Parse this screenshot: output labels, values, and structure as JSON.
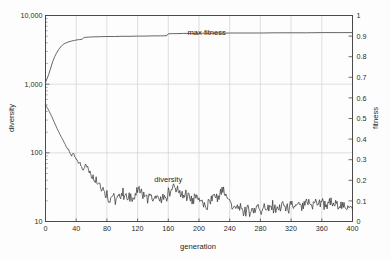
{
  "chart_data": {
    "type": "line",
    "title": "",
    "xlabel": "generation",
    "ylabel": "diversity",
    "y2label": "fitness",
    "xlim": [
      0,
      400
    ],
    "ylim": [
      10,
      10000
    ],
    "yscale": "log",
    "y2lim": [
      0,
      1
    ],
    "y2scale": "linear",
    "grid": true,
    "legend_position": "inline-annotation",
    "xticks": [
      "0",
      "40",
      "80",
      "120",
      "160",
      "200",
      "240",
      "280",
      "320",
      "360",
      "400"
    ],
    "xtick_values": [
      0,
      40,
      80,
      120,
      160,
      200,
      240,
      280,
      320,
      360,
      400
    ],
    "yticks": [
      "10,000",
      "1,000",
      "100",
      "10"
    ],
    "ytick_values": [
      10000,
      1000,
      100,
      10
    ],
    "y2ticks": [
      "1",
      "0.9",
      "0.8",
      "0.7",
      "0.6",
      "0.5",
      "0.4",
      "0.3",
      "0.2",
      "0.1",
      "0"
    ],
    "y2tick_values": [
      1,
      0.9,
      0.8,
      0.7,
      0.6,
      0.5,
      0.4,
      0.3,
      0.2,
      0.1,
      0
    ],
    "annotations": [
      {
        "text": "max fitness",
        "x": 210,
        "y": 0.905
      },
      {
        "text": "diversity",
        "x": 160,
        "y": 38
      }
    ],
    "series": [
      {
        "name": "max fitness",
        "axis": "right",
        "color": "#555555",
        "x": [
          0,
          2,
          4,
          6,
          8,
          10,
          12,
          14,
          16,
          18,
          20,
          22,
          24,
          26,
          28,
          30,
          32,
          34,
          36,
          38,
          40,
          44,
          48,
          50,
          52,
          56,
          60,
          70,
          80,
          90,
          100,
          110,
          120,
          130,
          140,
          150,
          158,
          160,
          165,
          170,
          180,
          190,
          200,
          220,
          240,
          260,
          280,
          300,
          320,
          340,
          360,
          380,
          400
        ],
        "values": [
          0.676,
          0.693,
          0.712,
          0.735,
          0.76,
          0.782,
          0.8,
          0.815,
          0.828,
          0.839,
          0.848,
          0.856,
          0.862,
          0.866,
          0.869,
          0.872,
          0.874,
          0.876,
          0.878,
          0.879,
          0.881,
          0.883,
          0.885,
          0.893,
          0.894,
          0.895,
          0.896,
          0.897,
          0.898,
          0.898,
          0.899,
          0.899,
          0.9,
          0.9,
          0.901,
          0.901,
          0.902,
          0.911,
          0.912,
          0.912,
          0.913,
          0.913,
          0.914,
          0.914,
          0.915,
          0.915,
          0.915,
          0.916,
          0.916,
          0.916,
          0.917,
          0.917,
          0.917
        ]
      },
      {
        "name": "diversity",
        "axis": "left",
        "color": "#3a3a3a",
        "x": [
          0,
          4,
          8,
          12,
          16,
          20,
          24,
          28,
          32,
          34,
          36,
          38,
          40,
          44,
          48,
          52,
          56,
          60,
          64,
          68,
          72,
          76,
          80,
          84,
          88,
          92,
          96,
          100,
          104,
          108,
          112,
          116,
          120,
          124,
          128,
          132,
          136,
          140,
          144,
          148,
          152,
          156,
          160,
          164,
          168,
          172,
          176,
          180,
          184,
          188,
          192,
          196,
          200,
          204,
          208,
          212,
          216,
          220,
          224,
          228,
          232,
          236,
          240,
          244,
          248,
          252,
          256,
          260,
          264,
          268,
          272,
          276,
          280,
          284,
          288,
          292,
          296,
          300,
          304,
          308,
          312,
          316,
          320,
          324,
          328,
          332,
          336,
          340,
          344,
          348,
          352,
          356,
          360,
          364,
          368,
          372,
          376,
          380,
          384,
          388,
          392,
          396,
          400
        ],
        "values": [
          500,
          420,
          340,
          270,
          215,
          175,
          145,
          120,
          100,
          92,
          96,
          88,
          80,
          70,
          62,
          66,
          58,
          50,
          44,
          38,
          33,
          29,
          25,
          21,
          24,
          20,
          23,
          26,
          24,
          21,
          25,
          22,
          27,
          31,
          24,
          21,
          25,
          20,
          24,
          19,
          23,
          21,
          26,
          30,
          33,
          28,
          25,
          22,
          26,
          23,
          20,
          24,
          22,
          19,
          15,
          18,
          22,
          25,
          21,
          26,
          28,
          24,
          20,
          17,
          15,
          16,
          14,
          15,
          16,
          14,
          15,
          16,
          15,
          17,
          16,
          15,
          17,
          16,
          15,
          18,
          16,
          15,
          17,
          16,
          18,
          17,
          16,
          19,
          18,
          17,
          19,
          18,
          20,
          18,
          17,
          19,
          17,
          18,
          17,
          16,
          18,
          16,
          15
        ]
      }
    ]
  },
  "axes": {
    "x_title": "generation",
    "y_left_title": "diversity",
    "y_right_title": "fitness"
  },
  "labels": {
    "max_fitness": "max fitness",
    "diversity": "diversity"
  },
  "colors": {
    "background": "#fdfdfd",
    "frame": "#4a4a4a",
    "grid": "#c9c9c9",
    "max_fitness_line": "#555555",
    "diversity_line": "#3a3a3a",
    "text": "#1f1f1f"
  }
}
